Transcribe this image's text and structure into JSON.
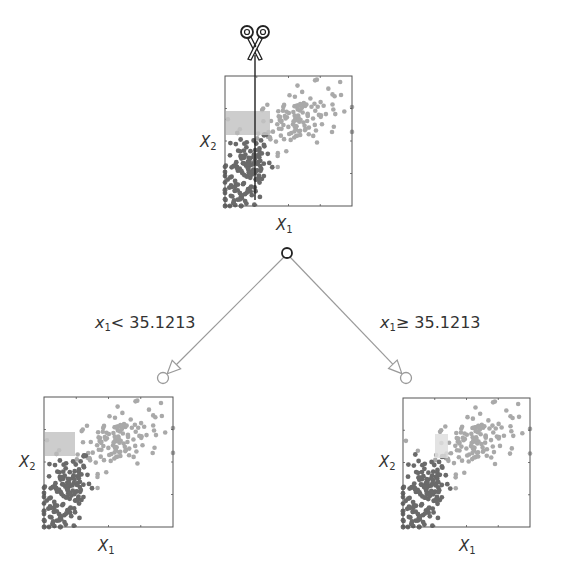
{
  "figure": {
    "colors": {
      "dark_points": "#6a6a6a",
      "light_points": "#a9a9a9",
      "axes": "#555555",
      "edge": "#9a9a9a",
      "root_node": "#222222",
      "child_node": "#9a9a9a",
      "highlight_rect": "#c4c4c4",
      "highlight_rect_light": "#dedede"
    },
    "root": {
      "plot": {
        "x": 225,
        "y": 76,
        "w": 127,
        "h": 130
      },
      "x_label_var": "X",
      "x_label_sub": "1",
      "y_label_var": "X",
      "y_label_sub": "2",
      "highlight": {
        "x": 226,
        "y": 111,
        "w": 44,
        "h": 24
      },
      "cut_line_x": 255,
      "scissors_icon": "scissors"
    },
    "root_node": {
      "x": 287,
      "y": 253
    },
    "left_child": {
      "node": {
        "x": 163,
        "y": 378
      },
      "condition_var": "x",
      "condition_sub": "1",
      "condition_text": "< 35.1213",
      "plot": {
        "x": 44,
        "y": 397,
        "w": 129,
        "h": 130
      },
      "x_label_var": "X",
      "x_label_sub": "1",
      "y_label_var": "X",
      "y_label_sub": "2",
      "highlight": {
        "x": 45,
        "y": 432,
        "w": 30,
        "h": 24
      }
    },
    "right_child": {
      "node": {
        "x": 406,
        "y": 378
      },
      "condition_var": "x",
      "condition_sub": "1",
      "condition_text": "≥ 35.1213",
      "plot": {
        "x": 403,
        "y": 398,
        "w": 127,
        "h": 129
      },
      "x_label_var": "X",
      "x_label_sub": "1",
      "y_label_var": "X",
      "y_label_sub": "2",
      "highlight": {
        "x": 435,
        "y": 434,
        "w": 13,
        "h": 24
      }
    }
  }
}
